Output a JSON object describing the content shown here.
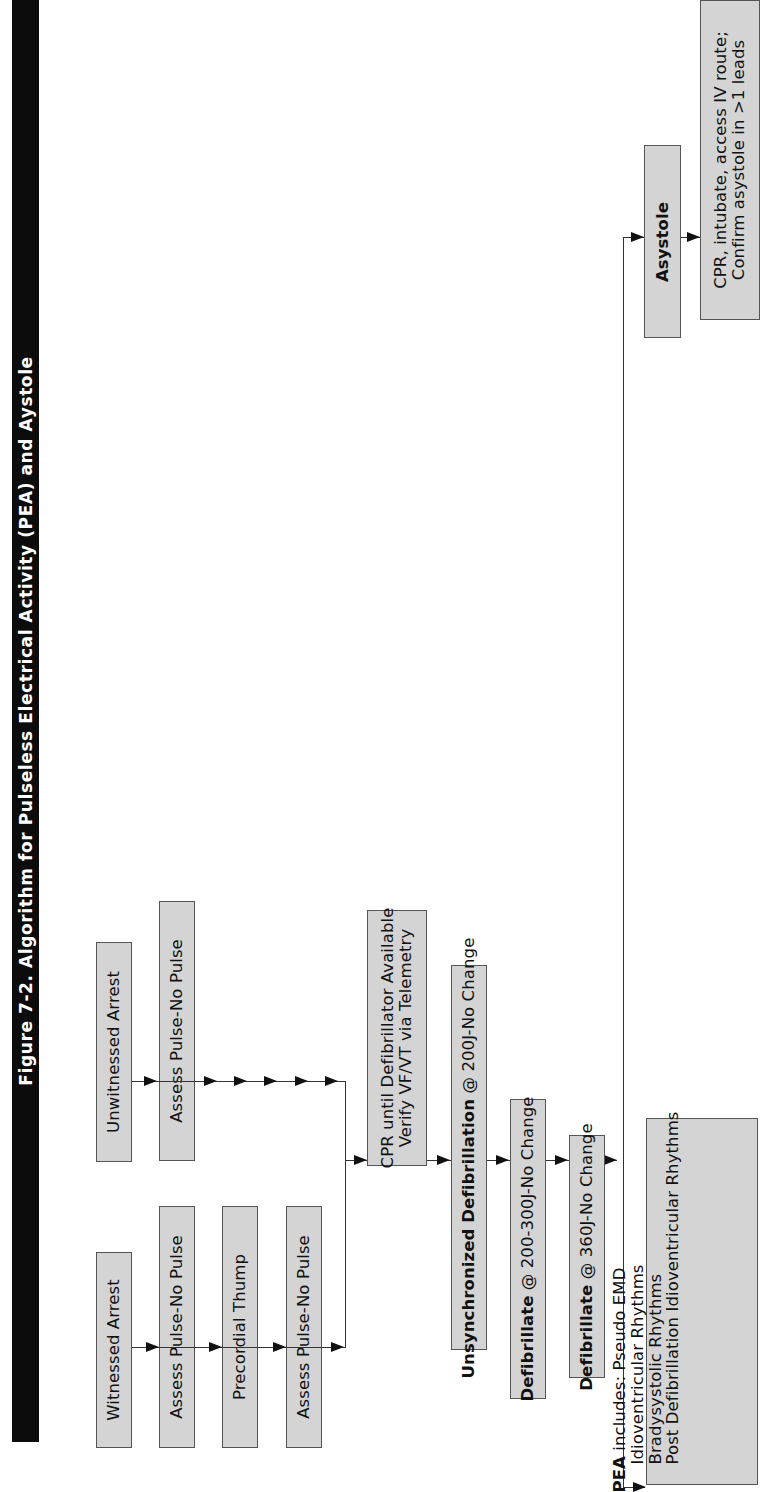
{
  "figure": {
    "title": "Figure 7-2. Algorithm for Pulseless Electrical Activity (PEA) and Aystole"
  },
  "witnessed_path": {
    "start": "Witnessed Arrest",
    "steps": [
      "Assess Pulse-No Pulse",
      "Precordial Thump",
      "Assess Pulse-No Pulse"
    ]
  },
  "unwitnessed_path": {
    "start": "Unwitnessed Arrest",
    "steps": [
      "Assess Pulse-No Pulse"
    ]
  },
  "main_sequence": {
    "cpr": {
      "line1": "CPR until Defibrillator Available",
      "line2": "Verify VF/VT via Telemetry"
    },
    "unsync": {
      "bold": "Unsynchronized Defibrillation",
      "rest": " @ 200J-No Change"
    },
    "defib2": {
      "bold": "Defibrillate",
      "rest": " @ 200-300J-No Change"
    },
    "defib3": {
      "bold": "Defibrillate",
      "rest": " @ 360J-No Change"
    }
  },
  "pea": {
    "bold": "PEA",
    "intro": " includes: Pseudo EMD",
    "items": [
      "Idioventricular Rhythms",
      "Bradysystolic Rhythms",
      "Post Defibrillation Idioventricular Rhythms"
    ]
  },
  "asystole": {
    "label": "Asystole",
    "action_line1": "CPR, intubate, access IV route;",
    "action_line2": "Confirm asystole in >1 leads"
  },
  "colors": {
    "box_fill": "#d4d4d4",
    "title_bg": "#0c0c0c",
    "title_text": "#ffffff",
    "line": "#111111"
  }
}
